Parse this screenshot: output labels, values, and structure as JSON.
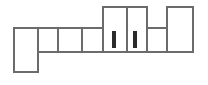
{
  "diagram": {
    "type": "architectural-floor-plan",
    "canvas": {
      "width": 208,
      "height": 85
    },
    "style": {
      "background_color": "#ffffff",
      "wall_color": "#6b6b6b",
      "wall_color_dark": "#555555",
      "room_fill": "#ffffff",
      "door_mark_color": "#2b2b2b",
      "wall_thickness": 2.0,
      "wall_thickness_thin": 1.6
    },
    "bands": {
      "main_band": {
        "top": 28,
        "bottom": 52
      },
      "upper_band": {
        "top": 7,
        "bottom": 52
      },
      "lower_wing": {
        "top": 28,
        "bottom": 72
      }
    },
    "rooms": [
      {
        "id": "room-west-wing",
        "label": "West Wing",
        "x": 14,
        "y": 28,
        "width": 24,
        "height": 44
      },
      {
        "id": "room-corridor-a",
        "label": "Corridor A",
        "x": 38,
        "y": 28,
        "width": 20,
        "height": 24
      },
      {
        "id": "room-corridor-b",
        "label": "Corridor B",
        "x": 58,
        "y": 28,
        "width": 24,
        "height": 24
      },
      {
        "id": "room-corridor-c",
        "label": "Corridor C",
        "x": 82,
        "y": 28,
        "width": 21,
        "height": 24
      },
      {
        "id": "room-north-hall-left",
        "label": "North Hall Left",
        "x": 103,
        "y": 7,
        "width": 24,
        "height": 45
      },
      {
        "id": "room-north-hall-right",
        "label": "North Hall Right",
        "x": 127,
        "y": 7,
        "width": 20,
        "height": 45
      },
      {
        "id": "room-east-bay",
        "label": "East Bay",
        "x": 147,
        "y": 28,
        "width": 20,
        "height": 24
      },
      {
        "id": "room-east-tower",
        "label": "East Tower",
        "x": 167,
        "y": 7,
        "width": 26,
        "height": 45
      }
    ],
    "door_marks": [
      {
        "id": "door-mark-left",
        "label": "Door Left",
        "x": 112,
        "y": 31,
        "width": 4,
        "height": 17
      },
      {
        "id": "door-mark-right",
        "label": "Door Right",
        "x": 133,
        "y": 31,
        "width": 4,
        "height": 17
      }
    ],
    "interior_walls": [
      {
        "id": "wall-v-38",
        "x1": 38,
        "y1": 28,
        "x2": 38,
        "y2": 52
      },
      {
        "id": "wall-v-58",
        "x1": 58,
        "y1": 28,
        "x2": 58,
        "y2": 52
      },
      {
        "id": "wall-v-82",
        "x1": 82,
        "y1": 28,
        "x2": 82,
        "y2": 52
      },
      {
        "id": "wall-v-103",
        "x1": 103,
        "y1": 7,
        "x2": 103,
        "y2": 52
      },
      {
        "id": "wall-v-127",
        "x1": 127,
        "y1": 7,
        "x2": 127,
        "y2": 52
      },
      {
        "id": "wall-v-147",
        "x1": 147,
        "y1": 7,
        "x2": 147,
        "y2": 52
      },
      {
        "id": "wall-v-167",
        "x1": 167,
        "y1": 7,
        "x2": 167,
        "y2": 52
      },
      {
        "id": "wall-h-main-top-38-103",
        "x1": 38,
        "y1": 28,
        "x2": 103,
        "y2": 28
      },
      {
        "id": "wall-h-main-top-147-167",
        "x1": 147,
        "y1": 28,
        "x2": 167,
        "y2": 28
      }
    ],
    "outline_path": "M14,28 L14,72 L38,72 L38,52 L103,52 L103,52 L147,52 L147,52 L167,52 L193,52 L193,7 L167,7 L167,28 L147,28 L147,7 L103,7 L103,28 L38,28 Z"
  }
}
